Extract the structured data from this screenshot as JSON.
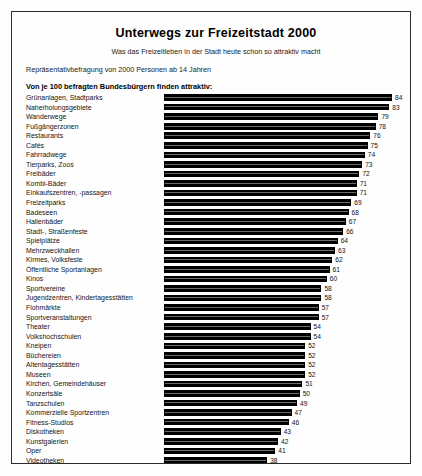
{
  "header": {
    "title": "Unterwegs zur Freizeitstadt 2000",
    "subtitle": "Was das Freizeitleben in der Stadt heute schon so attraktiv macht",
    "method": "Repräsentativbefragung von 2000 Personen ab 14 Jahren",
    "legend_line": "Von je 100 befragten Bundesbürgern finden attraktiv:"
  },
  "footer": {
    "source": "Quelle:  B·A·T Freizeit-Forschungsinstitut 1990"
  },
  "chart_data": {
    "type": "bar",
    "orientation": "horizontal",
    "title": "Unterwegs zur Freizeitstadt 2000",
    "subtitle": "Was das Freizeitleben in der Stadt heute schon so attraktiv macht",
    "xlabel": "Von je 100 befragten Bundesbürgern finden attraktiv:",
    "ylabel": "",
    "xlim": [
      0,
      84
    ],
    "grid": false,
    "legend": "none",
    "value_labels": true,
    "categories": [
      "Grünanlagen, Stadtparks",
      "Naherholungsgebiete",
      "Wanderwege",
      "Fußgängerzonen",
      "Restaurants",
      "Cafés",
      "Fahrradwege",
      "Tierparks, Zoos",
      "Freibäder",
      "Kombi-Bäder",
      "Einkaufszentren, -passagen",
      "Freizeitparks",
      "Badeseen",
      "Hallenbäder",
      "Stadt-, Straßenfeste",
      "Spielplätze",
      "Mehrzweckhallen",
      "Kirmes, Volksfeste",
      "Öffentliche Sportanlagen",
      "Kinos",
      "Sportvereine",
      "Jugendzentren, Kindertagesstätten",
      "Flohmärkte",
      "Sportveranstaltungen",
      "Theater",
      "Volkshochschulen",
      "Kneipen",
      "Büchereien",
      "Altentagesstätten",
      "Museen",
      "Kirchen, Gemeindehäuser",
      "Konzertsäle",
      "Tanzschulen",
      "Kommerzielle Sportzentren",
      "Fitness-Studios",
      "Diskotheken",
      "Kunstgalerien",
      "Oper",
      "Videotheken",
      "Jazz-, Ballettschulen",
      "Spielkasino",
      "Sex-Shops",
      "Spielhallen"
    ],
    "values": [
      84,
      83,
      79,
      78,
      76,
      75,
      74,
      73,
      72,
      71,
      71,
      69,
      68,
      67,
      66,
      64,
      63,
      62,
      61,
      60,
      58,
      58,
      57,
      57,
      54,
      54,
      52,
      52,
      52,
      52,
      51,
      50,
      49,
      47,
      46,
      43,
      42,
      41,
      38,
      35,
      33,
      29,
      14
    ],
    "values_trailing": [
      11,
      10
    ],
    "units": "von je 100 Befragten",
    "source": "Quelle:  B·A·T Freizeit-Forschungsinstitut 1990"
  }
}
